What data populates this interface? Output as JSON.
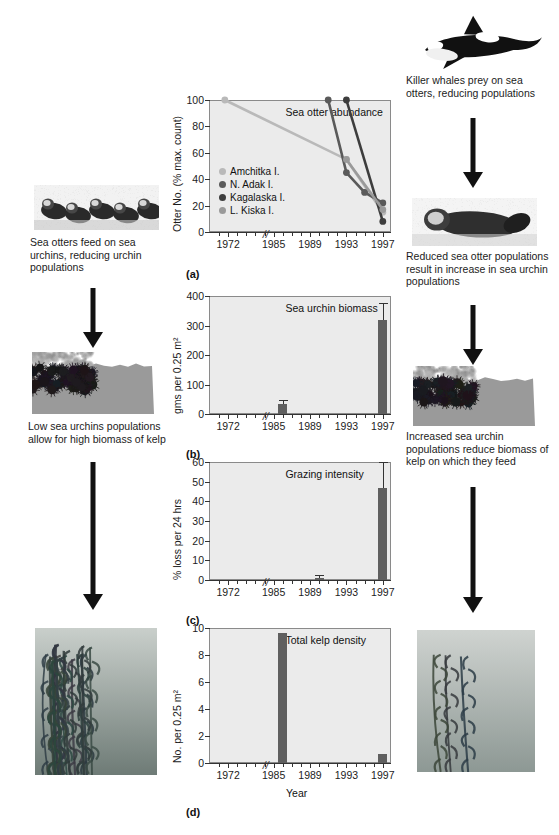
{
  "figure": {
    "left_captions": [
      "Sea otters feed on sea urchins, reducing urchin populations",
      "Low sea urchins populations allow for high biomass of kelp"
    ],
    "right_captions": [
      "Killer whales prey on sea otters, reducing populations",
      "Reduced sea otter populations result in increase in sea urchin populations",
      "Increased sea urchin populations reduce biomass of kelp on which they feed"
    ],
    "panel_letters": [
      "(a)",
      "(b)",
      "(c)",
      "(d)"
    ],
    "photos": {
      "otters_left": "sea-otters-raft-photo",
      "urchins_left": "sea-urchin-barren-photo",
      "kelp_left": "dense-kelp-forest-photo",
      "killer_whale": "killer-whale-photo",
      "otter_right": "single-sea-otter-photo",
      "urchins_right": "dense-sea-urchins-photo",
      "kelp_right": "sparse-kelp-photo"
    },
    "colors": {
      "plot_bg": "#ebebeb",
      "bar": "#5f5f5f",
      "amchitka": "#b9b9b9",
      "n_adak": "#5a5a5a",
      "kagalaska": "#3d3d3d",
      "l_kiska": "#9a9a9a",
      "axis": "#333333"
    }
  },
  "chart_data": [
    {
      "id": "a",
      "type": "line",
      "title": "Sea otter abundance",
      "ylabel": "Otter No. (% max. count)",
      "xlabel": "",
      "ylim": [
        0,
        100
      ],
      "yticks": [
        0,
        20,
        40,
        60,
        80,
        100
      ],
      "xticklabels": [
        "1972",
        "1985",
        "1989",
        "1993",
        "1997"
      ],
      "xlim": [
        1970,
        1998
      ],
      "axis_break_between": [
        "1972",
        "1985"
      ],
      "grid": false,
      "legend_position": "inside-left",
      "series": [
        {
          "name": "Amchitka I.",
          "color": "#b9b9b9",
          "x": [
            1971,
            1993,
            1997
          ],
          "y": [
            100,
            55,
            15
          ]
        },
        {
          "name": "N. Adak I.",
          "color": "#5a5a5a",
          "x": [
            1991,
            1993,
            1995,
            1997
          ],
          "y": [
            100,
            45,
            30,
            22
          ]
        },
        {
          "name": "Kagalaska I.",
          "color": "#3d3d3d",
          "x": [
            1993,
            1997
          ],
          "y": [
            100,
            8
          ]
        },
        {
          "name": "L. Kiska I.",
          "color": "#9a9a9a",
          "x": [
            1993,
            1997
          ],
          "y": [
            55,
            17
          ]
        }
      ]
    },
    {
      "id": "b",
      "type": "bar",
      "title": "Sea urchin biomass",
      "ylabel": "gms per 0.25 m²",
      "xlabel": "",
      "ylim": [
        0,
        400
      ],
      "yticks": [
        0,
        100,
        200,
        300,
        400
      ],
      "xticklabels": [
        "1972",
        "1985",
        "1989",
        "1993",
        "1997"
      ],
      "xlim": [
        1970,
        1998
      ],
      "axis_break_between": [
        "1972",
        "1985"
      ],
      "grid": false,
      "categories": [
        "1986",
        "1997"
      ],
      "x": [
        1986,
        1997
      ],
      "values": [
        35,
        320
      ],
      "errors": [
        12,
        55
      ]
    },
    {
      "id": "c",
      "type": "bar",
      "title": "Grazing intensity",
      "ylabel": "% loss per 24 hrs",
      "xlabel": "",
      "ylim": [
        0,
        60
      ],
      "yticks": [
        0,
        10,
        20,
        30,
        40,
        50,
        60
      ],
      "xticklabels": [
        "1972",
        "1985",
        "1989",
        "1993",
        "1997"
      ],
      "xlim": [
        1970,
        1998
      ],
      "axis_break_between": [
        "1972",
        "1985"
      ],
      "grid": false,
      "categories": [
        "1990",
        "1997"
      ],
      "x": [
        1990,
        1997
      ],
      "values": [
        1.2,
        47
      ],
      "errors": [
        1.5,
        13
      ]
    },
    {
      "id": "d",
      "type": "bar",
      "title": "Total kelp density",
      "ylabel": "No. per 0.25 m²",
      "xlabel": "Year",
      "ylim": [
        0,
        10
      ],
      "yticks": [
        0,
        2,
        4,
        6,
        8,
        10
      ],
      "xticklabels": [
        "1972",
        "1985",
        "1989",
        "1993",
        "1997"
      ],
      "xlim": [
        1970,
        1998
      ],
      "axis_break_between": [
        "1972",
        "1985"
      ],
      "grid": false,
      "categories": [
        "1986",
        "1997"
      ],
      "x": [
        1986,
        1997
      ],
      "values": [
        9.6,
        0.7
      ],
      "errors": [
        0,
        0
      ]
    }
  ]
}
